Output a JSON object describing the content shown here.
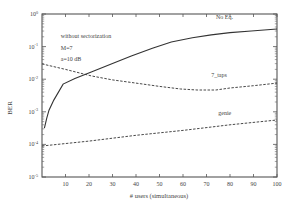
{
  "chart_data": {
    "type": "line",
    "title": "",
    "xlabel": "# users (simultaneous)",
    "ylabel": "BER",
    "xlim": [
      0,
      100
    ],
    "ylim": [
      1e-05,
      1
    ],
    "yscale": "log",
    "grid": false,
    "x_ticks": [
      10,
      20,
      30,
      40,
      50,
      60,
      70,
      80,
      90,
      100
    ],
    "y_ticks": [
      {
        "exp": 0,
        "label_base": "10",
        "label_exp": "0"
      },
      {
        "exp": -1,
        "label_base": "10",
        "label_exp": "-1"
      },
      {
        "exp": -2,
        "label_base": "10",
        "label_exp": "-2"
      },
      {
        "exp": -3,
        "label_base": "10",
        "label_exp": "-3"
      },
      {
        "exp": -4,
        "label_base": "10",
        "label_exp": "-4"
      },
      {
        "exp": -5,
        "label_base": "10",
        "label_exp": "-5"
      }
    ],
    "annotations": [
      {
        "text": "without sectorization",
        "x": 8,
        "y_log": -0.75
      },
      {
        "text": "M=7",
        "x": 8,
        "y_log": -1.1
      },
      {
        "text": "a=10 dB",
        "x": 8,
        "y_log": -1.45
      }
    ],
    "series": [
      {
        "name": "No Eq.",
        "style": "solid",
        "label_pos": {
          "x": 74,
          "y_log": -0.15
        },
        "x": [
          1,
          2,
          3,
          5,
          9,
          14,
          21,
          30,
          38,
          47,
          55,
          64,
          72,
          80,
          89,
          100
        ],
        "log10_y": [
          -3.5,
          -3.2,
          -2.95,
          -2.64,
          -2.15,
          -1.98,
          -1.78,
          -1.52,
          -1.29,
          -1.05,
          -0.86,
          -0.73,
          -0.64,
          -0.57,
          -0.52,
          -0.46
        ],
        "values": [
          0.00032,
          0.00063,
          0.0011,
          0.0023,
          0.0071,
          0.01,
          0.017,
          0.03,
          0.051,
          0.089,
          0.14,
          0.19,
          0.23,
          0.27,
          0.3,
          0.35
        ]
      },
      {
        "name": "7_taps",
        "style": "dashed",
        "label_pos": {
          "x": 72,
          "y_log": -1.92
        },
        "x": [
          0,
          10,
          21,
          30,
          40,
          50,
          59,
          66,
          74,
          80,
          90,
          100
        ],
        "log10_y": [
          -1.53,
          -1.7,
          -1.9,
          -2.02,
          -2.12,
          -2.22,
          -2.3,
          -2.33,
          -2.33,
          -2.27,
          -2.2,
          -2.12
        ],
        "values": [
          0.03,
          0.02,
          0.013,
          0.0095,
          0.0076,
          0.006,
          0.005,
          0.0047,
          0.0047,
          0.0054,
          0.0063,
          0.0076
        ]
      },
      {
        "name": "genie",
        "style": "dashed",
        "label_pos": {
          "x": 75,
          "y_log": -3.1
        },
        "x": [
          0,
          20,
          40,
          60,
          80,
          100
        ],
        "log10_y": [
          -4.05,
          -3.9,
          -3.72,
          -3.57,
          -3.4,
          -3.25
        ],
        "values": [
          8.9e-05,
          0.00013,
          0.00019,
          0.00027,
          0.0004,
          0.00056
        ]
      }
    ]
  }
}
